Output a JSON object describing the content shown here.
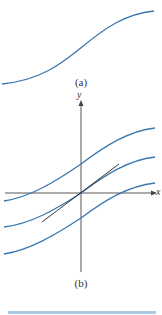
{
  "figure": {
    "panel_a": {
      "caption": "(a)",
      "curve_color": "#3a78b0"
    },
    "panel_b": {
      "caption": "(b)",
      "x_axis_label": "x",
      "y_axis_label": "y",
      "curve_color": "#3a78b0",
      "tangent_color": "#222222",
      "axis_color": "#444444",
      "curves": [
        "upper-shifted-curve",
        "curve-through-origin",
        "lower-shifted-curve"
      ],
      "tangent": "tangent-line-at-origin"
    },
    "bottom_bar_color": "#a9cbe6"
  }
}
